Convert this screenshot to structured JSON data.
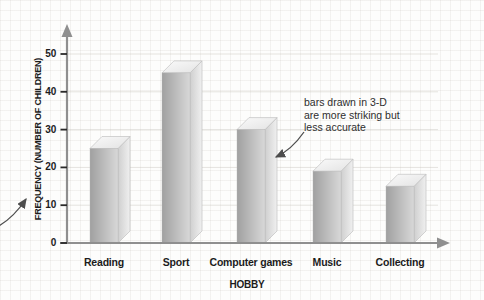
{
  "chart_data": {
    "type": "bar",
    "style": "3d",
    "title": "",
    "categories": [
      "Reading",
      "Sport",
      "Computer games",
      "Music",
      "Collecting"
    ],
    "values": [
      25,
      45,
      30,
      19,
      15
    ],
    "xlabel": "HOBBY",
    "ylabel": "FREQUENCY (NUMBER OF CHILDREN)",
    "ylim": [
      0,
      50
    ],
    "yticks": [
      0,
      10,
      20,
      30,
      40,
      50
    ],
    "grid": "faint horizontal gridlines at each y tick",
    "legend": "none",
    "colors": {
      "bar_front_dark": "#a0a0a0",
      "bar_front_light": "#d8d8d8",
      "bar_top_light": "#fafafa",
      "bar_top_dark": "#e3e3e3",
      "bar_side_dark": "#cfcfcf",
      "bar_side_light": "#f0f0f0",
      "bar_edge": "#b8b8b8",
      "axis": "#8f8f8f",
      "tick": "#2a2a2a",
      "gridline": "rgba(185,180,172,0.45)",
      "label_text": "#1c1c1c",
      "annotation_arrow": "#4d4d4d"
    }
  },
  "annotation": {
    "text": "bars drawn in 3-D\nare more striking but\nless accurate",
    "points_to": "Computer games bar"
  },
  "side_note_arrow": {
    "points_to": "y-axis label (FREQUENCY)",
    "from": "left edge of image"
  }
}
